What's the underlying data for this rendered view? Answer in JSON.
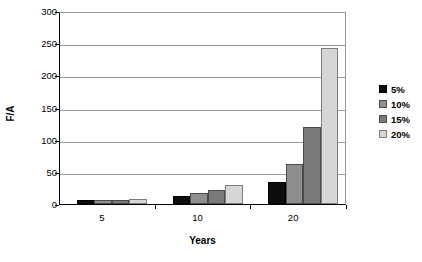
{
  "chart_data": {
    "type": "bar",
    "title": "",
    "xlabel": "Years",
    "ylabel": "F/A",
    "categories": [
      "5",
      "10",
      "20"
    ],
    "series": [
      {
        "name": "5%",
        "color": "#0d0d0d",
        "values": [
          6,
          13,
          34
        ]
      },
      {
        "name": "10%",
        "color": "#8e8e8e",
        "values": [
          6.5,
          17,
          62
        ]
      },
      {
        "name": "15%",
        "color": "#7a7a7a",
        "values": [
          7,
          22,
          120
        ]
      },
      {
        "name": "20%",
        "color": "#d6d6d6",
        "values": [
          7.5,
          30,
          243
        ]
      }
    ],
    "ylim": [
      0,
      300
    ],
    "yticks": [
      0,
      50,
      100,
      150,
      200,
      250,
      300
    ],
    "grid": true,
    "legend_position": "right",
    "orientation": "vertical",
    "grouping": "grouped"
  },
  "axes": {
    "y_title": "F/A",
    "x_title": "Years",
    "y_tick_labels": [
      "300",
      "250",
      "200",
      "150",
      "100",
      "50",
      "0"
    ],
    "x_tick_labels": [
      "5",
      "10",
      "20"
    ]
  },
  "legend": {
    "entries": [
      {
        "label": "5%",
        "swatch": "#0d0d0d"
      },
      {
        "label": "10%",
        "swatch": "#8e8e8e"
      },
      {
        "label": "15%",
        "swatch": "#7a7a7a"
      },
      {
        "label": "20%",
        "swatch": "#d6d6d6"
      }
    ]
  },
  "colors": {
    "background": "#ffffff",
    "axis": "#000000",
    "gridline": "#9a9a9a",
    "series_5": "#0d0d0d",
    "series_10": "#8e8e8e",
    "series_15": "#7a7a7a",
    "series_20": "#d6d6d6"
  }
}
